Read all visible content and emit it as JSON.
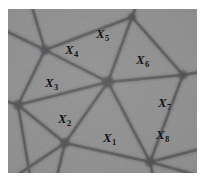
{
  "figure": {
    "kind": "grain-boundary-micrograph",
    "background_color": "#8d8d8d",
    "boundary_color": "#5c5c5f",
    "vertex_color": "#4a4a4d",
    "label_color": "#16161a",
    "frame_color": "#ffffff",
    "image_area": {
      "x": 8,
      "y": 9,
      "width": 189,
      "height": 164
    }
  },
  "labels": [
    {
      "name": "grain-label-x1",
      "base": "X",
      "subscript": "1",
      "x": 95,
      "y": 122
    },
    {
      "name": "grain-label-x2",
      "base": "X",
      "subscript": "2",
      "x": 50,
      "y": 103
    },
    {
      "name": "grain-label-x3",
      "base": "X",
      "subscript": "3",
      "x": 37,
      "y": 67
    },
    {
      "name": "grain-label-x4",
      "base": "X",
      "subscript": "4",
      "x": 57,
      "y": 34
    },
    {
      "name": "grain-label-x5",
      "base": "X",
      "subscript": "5",
      "x": 88,
      "y": 18
    },
    {
      "name": "grain-label-x6",
      "base": "X",
      "subscript": "6",
      "x": 128,
      "y": 44
    },
    {
      "name": "grain-label-x7",
      "base": "X",
      "subscript": "7",
      "x": 150,
      "y": 87
    },
    {
      "name": "grain-label-x8",
      "base": "X",
      "subscript": "8",
      "x": 148,
      "y": 119
    }
  ],
  "vertices": [
    {
      "name": "vertex-top-left",
      "x": 37,
      "y": 41,
      "r": 5.0
    },
    {
      "name": "vertex-center-hub",
      "x": 100,
      "y": 73,
      "r": 6.0
    },
    {
      "name": "vertex-left-edge",
      "x": 10,
      "y": 96,
      "r": 5.0
    },
    {
      "name": "vertex-bottom-left",
      "x": 57,
      "y": 134,
      "r": 5.0
    },
    {
      "name": "vertex-right",
      "x": 175,
      "y": 66,
      "r": 4.5
    },
    {
      "name": "vertex-bottom-right",
      "x": 142,
      "y": 153,
      "r": 5.0
    },
    {
      "name": "vertex-top-edge",
      "x": 124,
      "y": 8,
      "r": 4.0
    }
  ],
  "boundaries": [
    {
      "name": "boundary-topleft-to-topedge",
      "x1": 37,
      "y1": 41,
      "x2": 124,
      "y2": 8
    },
    {
      "name": "boundary-topleft-to-center",
      "x1": 37,
      "y1": 41,
      "x2": 100,
      "y2": 73
    },
    {
      "name": "boundary-topleft-to-topborder",
      "x1": 37,
      "y1": 41,
      "x2": 24,
      "y2": -2
    },
    {
      "name": "boundary-topleft-to-leftborder",
      "x1": 37,
      "y1": 41,
      "x2": -2,
      "y2": 22
    },
    {
      "name": "boundary-topleft-to-leftedge",
      "x1": 37,
      "y1": 41,
      "x2": 10,
      "y2": 96
    },
    {
      "name": "boundary-topedge-to-center",
      "x1": 124,
      "y1": 8,
      "x2": 100,
      "y2": 73
    },
    {
      "name": "boundary-topedge-to-right",
      "x1": 124,
      "y1": 8,
      "x2": 175,
      "y2": 66
    },
    {
      "name": "boundary-topedge-to-topborder",
      "x1": 124,
      "y1": 8,
      "x2": 128,
      "y2": -3
    },
    {
      "name": "boundary-center-to-right",
      "x1": 100,
      "y1": 73,
      "x2": 175,
      "y2": 66
    },
    {
      "name": "boundary-center-to-bottomright",
      "x1": 100,
      "y1": 73,
      "x2": 142,
      "y2": 153
    },
    {
      "name": "boundary-center-to-bottomleft",
      "x1": 100,
      "y1": 73,
      "x2": 57,
      "y2": 134
    },
    {
      "name": "boundary-center-to-leftedge",
      "x1": 100,
      "y1": 73,
      "x2": 10,
      "y2": 96
    },
    {
      "name": "boundary-right-to-rightborder",
      "x1": 175,
      "y1": 66,
      "x2": 192,
      "y2": 63
    },
    {
      "name": "boundary-right-to-bottomright",
      "x1": 175,
      "y1": 66,
      "x2": 142,
      "y2": 153
    },
    {
      "name": "boundary-leftedge-to-bottomleft",
      "x1": 10,
      "y1": 96,
      "x2": 57,
      "y2": 134
    },
    {
      "name": "boundary-leftedge-to-leftborder",
      "x1": 10,
      "y1": 96,
      "x2": -3,
      "y2": 92
    },
    {
      "name": "boundary-leftedge-to-bottomborder",
      "x1": 10,
      "y1": 96,
      "x2": 22,
      "y2": 167
    },
    {
      "name": "boundary-bottomleft-to-bottomrt",
      "x1": 57,
      "y1": 134,
      "x2": 142,
      "y2": 153
    },
    {
      "name": "boundary-bottomleft-to-botborder",
      "x1": 57,
      "y1": 134,
      "x2": 49,
      "y2": 167
    },
    {
      "name": "boundary-bottomleft-to-leftlower",
      "x1": 57,
      "y1": 134,
      "x2": 8,
      "y2": 167
    },
    {
      "name": "boundary-bottomright-to-botborder",
      "x1": 142,
      "y1": 153,
      "x2": 145,
      "y2": 167
    },
    {
      "name": "boundary-bottomright-to-rightbrd",
      "x1": 142,
      "y1": 153,
      "x2": 192,
      "y2": 140
    },
    {
      "name": "boundary-bottomright-to-rightlow",
      "x1": 142,
      "y1": 153,
      "x2": 192,
      "y2": 167
    }
  ]
}
